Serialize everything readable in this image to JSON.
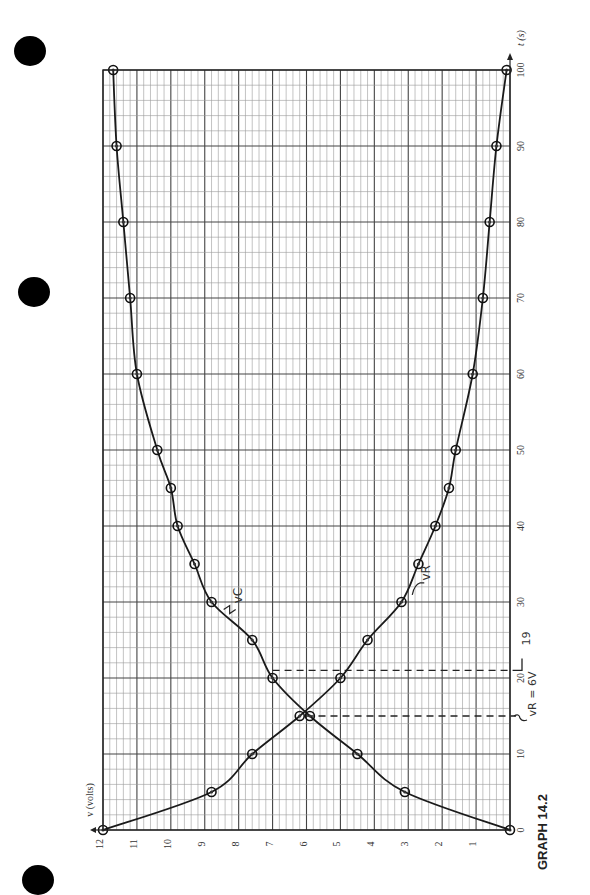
{
  "page": {
    "caption": "GRAPH 14.2",
    "hole_count": 3
  },
  "chart_data": {
    "type": "line",
    "orientation": "rotated-90",
    "title": "",
    "caption": "GRAPH 14.2",
    "xlabel": "t (s)",
    "ylabel": "v (volts)",
    "xlim": [
      0,
      100
    ],
    "ylim": [
      0,
      12
    ],
    "x_ticks": [
      0,
      10,
      20,
      30,
      40,
      50,
      60,
      70,
      80,
      90,
      100
    ],
    "x_tick_labels": [
      "0",
      "10",
      "20",
      "30",
      "40",
      "50",
      "60",
      "70",
      "80",
      "90",
      "100"
    ],
    "y_ticks": [
      0,
      1,
      2,
      3,
      4,
      5,
      6,
      7,
      8,
      9,
      10,
      11,
      12
    ],
    "y_tick_labels": [
      "",
      "1",
      "2",
      "3",
      "4",
      "5",
      "6",
      "7",
      "8",
      "9",
      "10",
      "11",
      "12"
    ],
    "grid": true,
    "series": [
      {
        "name": "vC",
        "label": "vC",
        "x": [
          0,
          5,
          10,
          15,
          20,
          25,
          30,
          35,
          40,
          45,
          50,
          60,
          70,
          80,
          90,
          100
        ],
        "values": [
          0,
          3.1,
          4.5,
          5.9,
          7.0,
          7.6,
          8.8,
          9.3,
          9.8,
          10.0,
          10.4,
          11.0,
          11.2,
          11.4,
          11.6,
          11.7
        ]
      },
      {
        "name": "vR",
        "label": "vR",
        "x": [
          0,
          5,
          10,
          15,
          20,
          25,
          30,
          35,
          40,
          45,
          50,
          60,
          70,
          80,
          90,
          100
        ],
        "values": [
          12,
          8.8,
          7.6,
          6.2,
          5.0,
          4.2,
          3.2,
          2.7,
          2.2,
          1.8,
          1.6,
          1.1,
          0.8,
          0.6,
          0.4,
          0.1
        ]
      }
    ],
    "reference_lines": [
      {
        "t": 15,
        "v_from": 6,
        "label": "vR = 6V"
      },
      {
        "t": 21,
        "v_from": 7,
        "label": "19"
      }
    ],
    "annotations": [
      {
        "text": "vC",
        "near_series": "vC",
        "t": 29
      },
      {
        "text": "vR",
        "near_series": "vR",
        "t": 32
      }
    ]
  }
}
